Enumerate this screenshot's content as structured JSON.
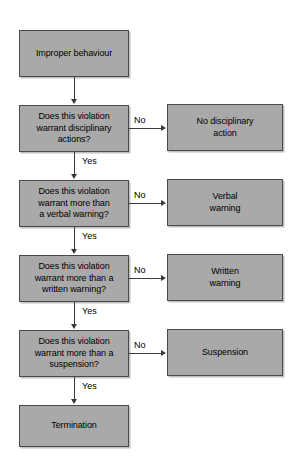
{
  "diagram": {
    "colors": {
      "node_fill": "#a9a9a9",
      "node_border": "#4a4a4a",
      "connector": "#3a3a3a",
      "text": "#000000",
      "background": "#ffffff"
    },
    "nodes": [
      {
        "id": "start",
        "label": "Improper behaviour"
      },
      {
        "id": "decision1",
        "label": "Does this violation\nwarrant disciplinary\nactions?"
      },
      {
        "id": "outcome1",
        "label": "No disciplinary\naction"
      },
      {
        "id": "decision2",
        "label": "Does this violation\nwarrant more than\na verbal warning?"
      },
      {
        "id": "outcome2",
        "label": "Verbal\nwarning"
      },
      {
        "id": "decision3",
        "label": "Does this violation\nwarrant more than a\nwritten warning?"
      },
      {
        "id": "outcome3",
        "label": "Written\nwarning"
      },
      {
        "id": "decision4",
        "label": "Does this violation\nwarrant more than a\nsuspension?"
      },
      {
        "id": "outcome4",
        "label": "Suspension"
      },
      {
        "id": "end",
        "label": "Termination"
      }
    ],
    "edge_labels": {
      "no1": "No",
      "yes1": "Yes",
      "no2": "No",
      "yes2": "Yes",
      "no3": "No",
      "yes3": "Yes",
      "no4": "No",
      "yes4": "Yes"
    }
  }
}
